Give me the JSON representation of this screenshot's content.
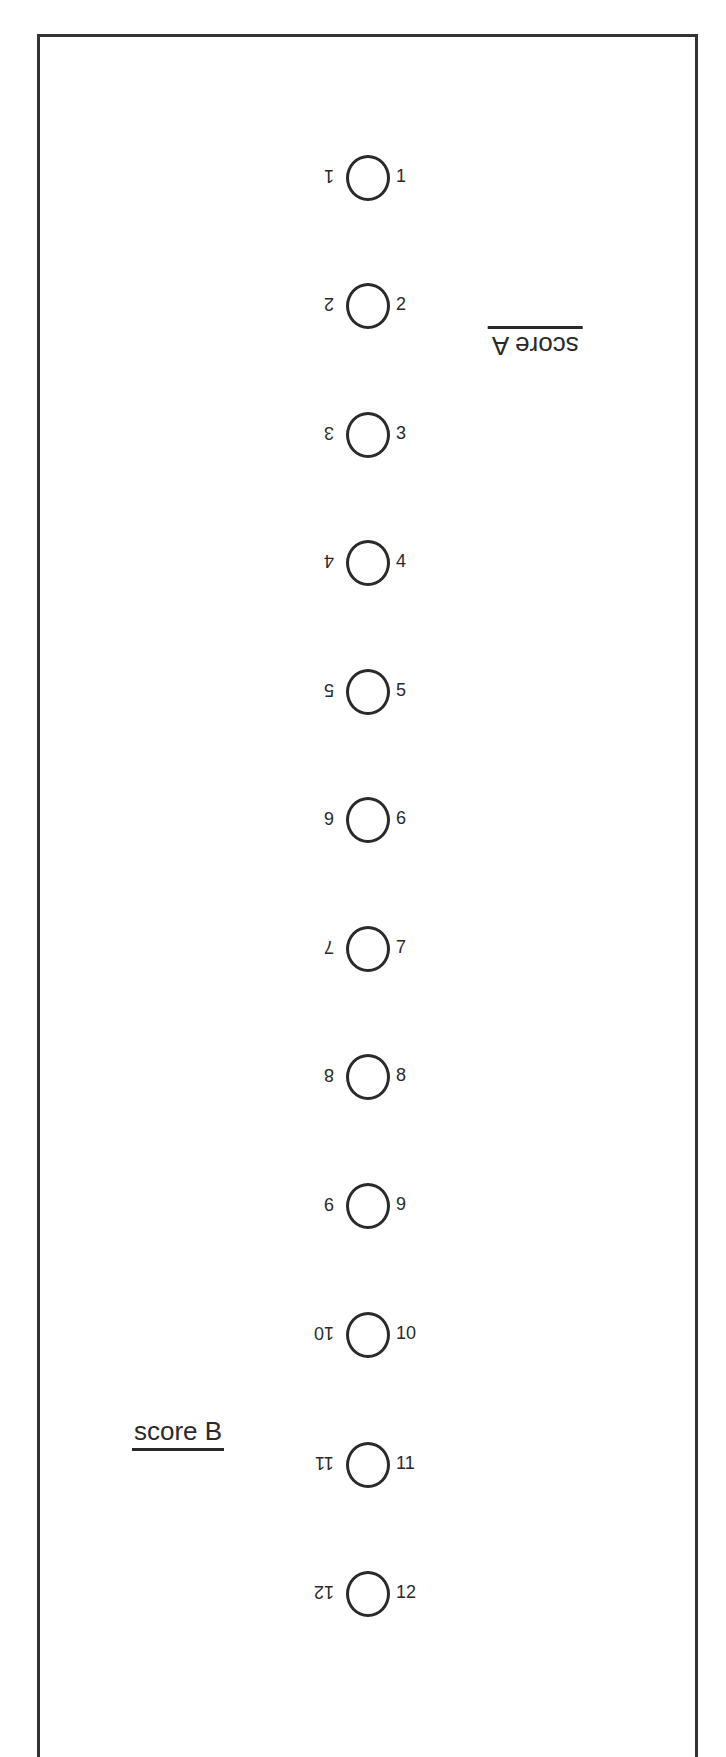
{
  "sheet": {
    "score_a_label": "score A",
    "score_b_label": "score B",
    "rows": [
      {
        "left": "1",
        "right": "1"
      },
      {
        "left": "2",
        "right": "2"
      },
      {
        "left": "3",
        "right": "3"
      },
      {
        "left": "4",
        "right": "4"
      },
      {
        "left": "5",
        "right": "5"
      },
      {
        "left": "6",
        "right": "6"
      },
      {
        "left": "7",
        "right": "7"
      },
      {
        "left": "8",
        "right": "8"
      },
      {
        "left": "9",
        "right": "9"
      },
      {
        "left": "10",
        "right": "10"
      },
      {
        "left": "11",
        "right": "11"
      },
      {
        "left": "12",
        "right": "12"
      }
    ]
  }
}
